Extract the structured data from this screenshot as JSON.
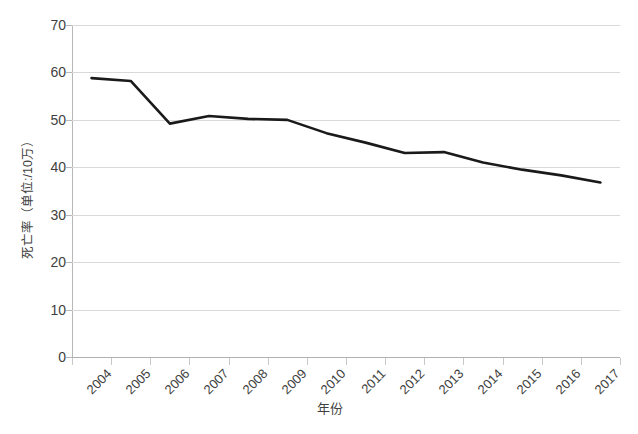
{
  "chart_data": {
    "type": "line",
    "title": "",
    "xlabel": "年份",
    "ylabel": "死亡率（单位:/10万）",
    "categories": [
      "2004",
      "2005",
      "2006",
      "2007",
      "2008",
      "2009",
      "2010",
      "2011",
      "2012",
      "2013",
      "2014",
      "2015",
      "2016",
      "2017"
    ],
    "series": [
      {
        "name": "死亡率",
        "values": [
          58.8,
          58.2,
          49.2,
          50.8,
          50.2,
          50.0,
          47.2,
          45.2,
          43.0,
          43.2,
          41.0,
          39.5,
          38.3,
          36.8
        ]
      }
    ],
    "ylim": [
      0,
      70
    ],
    "ytick_values": [
      "70",
      "60",
      "50",
      "40",
      "30",
      "20",
      "10",
      "0"
    ],
    "ytick_numbers": [
      70,
      60,
      50,
      40,
      30,
      20,
      10,
      0
    ],
    "grid": true,
    "legend": "none",
    "line_color": "#1a1a1a",
    "grid_color": "#d9d9d9",
    "axis_color": "#b8b8b8",
    "text_color": "#3f3f3f",
    "background_color": "#ffffff"
  }
}
